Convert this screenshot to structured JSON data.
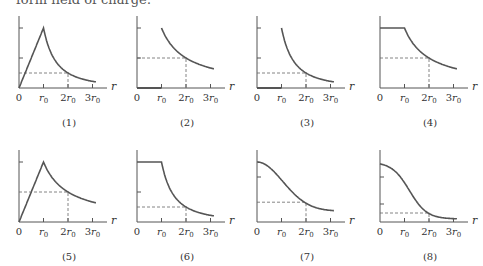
{
  "header": {
    "text": "form field of charge:"
  },
  "chart_data": [
    {
      "type": "line",
      "id": 1,
      "label": "(1)",
      "xlabel": "r",
      "x_ticks": [
        "0",
        "r0",
        "2r0",
        "3r0"
      ],
      "shape": "linear rise 0..r0 to peak, then 1/r^2 decay",
      "x": [
        0,
        1,
        1.5,
        2,
        2.5,
        3
      ],
      "y": [
        0,
        1.0,
        0.44,
        0.25,
        0.16,
        0.11
      ],
      "dashed_ref": {
        "x": 2,
        "y": 0.25
      },
      "y_ticks": [
        1.0,
        0.5
      ]
    },
    {
      "type": "line",
      "id": 2,
      "label": "(2)",
      "xlabel": "r",
      "x_ticks": [
        "0",
        "r0",
        "2r0",
        "3r0"
      ],
      "shape": "zero for r<r0, then 1/r decay",
      "x": [
        0,
        1,
        1,
        1.5,
        2,
        2.5,
        3
      ],
      "y": [
        0,
        0,
        1.0,
        0.67,
        0.5,
        0.4,
        0.33
      ],
      "dashed_ref": {
        "x": 2,
        "y": 0.5
      },
      "y_ticks": [
        1.0,
        0.5
      ]
    },
    {
      "type": "line",
      "id": 3,
      "label": "(3)",
      "xlabel": "r",
      "x_ticks": [
        "0",
        "r0",
        "2r0",
        "3r0"
      ],
      "shape": "zero for r<r0, then 1/r^2 decay",
      "x": [
        0,
        1,
        1,
        1.5,
        2,
        2.5,
        3
      ],
      "y": [
        0,
        0,
        1.0,
        0.44,
        0.25,
        0.16,
        0.11
      ],
      "dashed_ref": {
        "x": 2,
        "y": 0.25
      },
      "y_ticks": [
        1.0,
        0.5
      ]
    },
    {
      "type": "line",
      "id": 4,
      "label": "(4)",
      "xlabel": "r",
      "x_ticks": [
        "0",
        "r0",
        "2r0",
        "3r0"
      ],
      "shape": "constant for r<r0, then 1/r decay",
      "x": [
        0,
        1,
        1.5,
        2,
        2.5,
        3
      ],
      "y": [
        1.0,
        1.0,
        0.67,
        0.5,
        0.4,
        0.33
      ],
      "dashed_ref": {
        "x": 2,
        "y": 0.5
      },
      "y_ticks": []
    },
    {
      "type": "line",
      "id": 5,
      "label": "(5)",
      "xlabel": "r",
      "x_ticks": [
        "0",
        "r0",
        "2r0",
        "3r0"
      ],
      "shape": "linear rise 0..r0 to peak, then 1/r decay",
      "x": [
        0,
        1,
        1.5,
        2,
        2.5,
        3
      ],
      "y": [
        0,
        1.0,
        0.67,
        0.5,
        0.4,
        0.33
      ],
      "dashed_ref": {
        "x": 2,
        "y": 0.5
      },
      "y_ticks": [
        1.0
      ]
    },
    {
      "type": "line",
      "id": 6,
      "label": "(6)",
      "xlabel": "r",
      "x_ticks": [
        "0",
        "r0",
        "2r0",
        "3r0"
      ],
      "shape": "constant for r<r0, then 1/r^2 decay",
      "x": [
        0,
        1,
        1.5,
        2,
        2.5,
        3
      ],
      "y": [
        1.0,
        1.0,
        0.44,
        0.25,
        0.16,
        0.11
      ],
      "dashed_ref": {
        "x": 2,
        "y": 0.25
      },
      "y_ticks": [
        0.5
      ]
    },
    {
      "type": "line",
      "id": 7,
      "label": "(7)",
      "xlabel": "r",
      "x_ticks": [
        "0",
        "r0",
        "2r0",
        "3r0"
      ],
      "shape": "smooth gaussian-like decay",
      "x": [
        0,
        0.5,
        1,
        1.5,
        2,
        2.5,
        3
      ],
      "y": [
        1.0,
        0.92,
        0.72,
        0.5,
        0.33,
        0.24,
        0.2
      ],
      "dashed_ref": {
        "x": 2,
        "y": 0.33
      },
      "y_ticks": [
        0.75
      ]
    },
    {
      "type": "line",
      "id": 8,
      "label": "(8)",
      "xlabel": "r",
      "x_ticks": [
        "0",
        "r0",
        "2r0",
        "3r0"
      ],
      "shape": "smooth sigmoid decay",
      "x": [
        0,
        0.5,
        1,
        1.5,
        2,
        2.5,
        3
      ],
      "y": [
        1.0,
        0.92,
        0.7,
        0.32,
        0.15,
        0.1,
        0.07
      ],
      "dashed_ref": {
        "x": 2,
        "y": 0.15
      },
      "y_ticks": [
        0.75,
        0.3
      ]
    }
  ],
  "panels": [
    {
      "label": "(1)"
    },
    {
      "label": "(2)"
    },
    {
      "label": "(3)"
    },
    {
      "label": "(4)"
    },
    {
      "label": "(5)"
    },
    {
      "label": "(6)"
    },
    {
      "label": "(7)"
    },
    {
      "label": "(8)"
    }
  ],
  "axis": {
    "xlabel": "r",
    "tick0": "0",
    "tick1": "r",
    "tick2": "2r",
    "tick3": "3r",
    "sub": "0"
  },
  "colors": {
    "curve": "#555555",
    "axis": "#555555",
    "dash": "#666666"
  }
}
